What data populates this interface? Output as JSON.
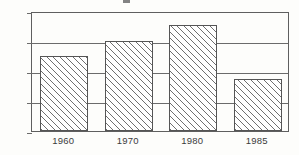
{
  "chart_data": {
    "type": "bar",
    "title": "",
    "xlabel": "",
    "ylabel": "",
    "categories": [
      "1960",
      "1970",
      "1980",
      "1985"
    ],
    "values": [
      10.0,
      12.0,
      14.2,
      7.0
    ],
    "ylim": [
      0,
      16
    ],
    "yticks": [
      0,
      4,
      8,
      12,
      16
    ],
    "ytick_labels": [
      "0%",
      "4%",
      "8%",
      "12%",
      "16%"
    ],
    "grid": true,
    "legend": "none",
    "bar_style": "white fill with 45-degree diagonal hatch",
    "colors": {
      "axis": "#5f5f5f",
      "grid": "#6b6b6b",
      "bar_outline": "#555555",
      "bar_fill": "#ffffff",
      "hatch": "#6f6f6f",
      "text": "#3b3b3b",
      "background": "#fdfdfb"
    }
  }
}
